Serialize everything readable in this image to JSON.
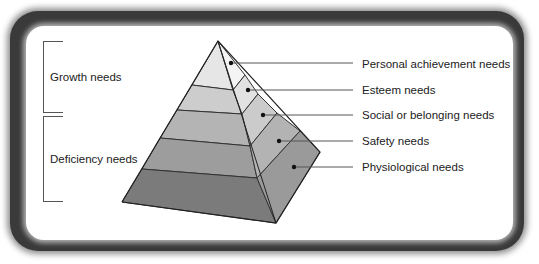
{
  "diagram": {
    "type": "pyramid",
    "title": "",
    "groups": [
      {
        "label": "Growth needs",
        "covers": [
          "Personal achievement needs",
          "Esteem needs"
        ]
      },
      {
        "label": "Deficiency needs",
        "covers": [
          "Social or belonging needs",
          "Safety needs",
          "Physiological needs"
        ]
      }
    ],
    "levels": [
      {
        "label": "Personal achievement needs",
        "order": 1,
        "color_front": "#e6e6e6",
        "color_side": "#f2f2f2"
      },
      {
        "label": "Esteem needs",
        "order": 2,
        "color_front": "#cdcdcd",
        "color_side": "#e2e2e2"
      },
      {
        "label": "Social or belonging needs",
        "order": 3,
        "color_front": "#b4b4b4",
        "color_side": "#cbcbcb"
      },
      {
        "label": "Safety needs",
        "order": 4,
        "color_front": "#9d9d9d",
        "color_side": "#b3b3b3"
      },
      {
        "label": "Physiological needs",
        "order": 5,
        "color_front": "#7b7b7b",
        "color_side": "#9a9a9a"
      }
    ]
  },
  "colors": {
    "frame": "#3a3a3a",
    "background": "#ffffff",
    "line": "#333333"
  }
}
